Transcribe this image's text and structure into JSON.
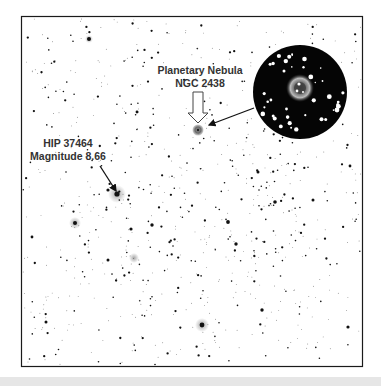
{
  "figure": {
    "frame": {
      "x": 21,
      "y": 16,
      "width": 342,
      "height": 351,
      "border_color": "#1a1a1a",
      "background": "#ffffff"
    },
    "star_color": "#111111",
    "inset_background": "#050505",
    "bottom_strip_color": "#e6e6e6"
  },
  "annotations": {
    "nebula": {
      "line1": "Planetary Nebula",
      "line2": "NGC 2438",
      "target": {
        "x": 198,
        "y": 129
      }
    },
    "star": {
      "line1": "HIP 37464",
      "line2": "Magnitude 8.66",
      "target": {
        "x": 117,
        "y": 193
      }
    }
  },
  "inset": {
    "description": "Zoomed view of NGC 2438 ring nebula",
    "center": {
      "x": 300,
      "y": 92
    },
    "radius": 47
  }
}
